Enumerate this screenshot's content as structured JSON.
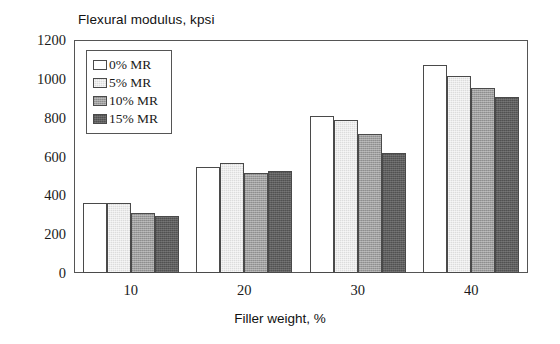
{
  "chart_data": {
    "type": "bar",
    "title": "",
    "ylabel": "Flexural modulus, kpsi",
    "xlabel": "Filler weight, %",
    "categories": [
      "10",
      "20",
      "30",
      "40"
    ],
    "series": [
      {
        "name": "0% MR",
        "color": "#ffffff",
        "values": [
          360,
          545,
          810,
          1070
        ]
      },
      {
        "name": "5% MR",
        "color": "#dcdcdc",
        "values": [
          360,
          565,
          790,
          1015
        ]
      },
      {
        "name": "10% MR",
        "color": "#9e9e9e",
        "values": [
          310,
          515,
          715,
          955
        ]
      },
      {
        "name": "15% MR",
        "color": "#5e5e5e",
        "values": [
          295,
          525,
          620,
          905
        ]
      }
    ],
    "ylim": [
      0,
      1200
    ],
    "ytick_labels": [
      "0",
      "200",
      "400",
      "600",
      "800",
      "1000",
      "1200"
    ],
    "ytick_values": [
      0,
      200,
      400,
      600,
      800,
      1000,
      1200
    ],
    "xtick_labels": [
      "10",
      "20",
      "30",
      "40"
    ],
    "grid": false,
    "legend_position": "top-left",
    "legend_entries": [
      "0% MR",
      "5% MR",
      "10% MR",
      "15% MR"
    ]
  }
}
